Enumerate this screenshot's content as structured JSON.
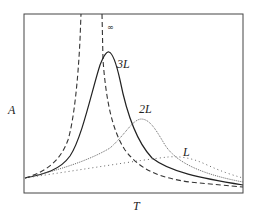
{
  "chart_data": {
    "type": "line",
    "title": "",
    "xlabel": "T",
    "ylabel": "A",
    "grid": false,
    "legend": "inline curve labels",
    "frame": {
      "left": 24,
      "top": 14,
      "right": 243,
      "bottom": 193
    },
    "series": [
      {
        "name": "∞",
        "label_text": "∞",
        "style": "dashed",
        "color": "#333333",
        "label_pos": [
          107,
          30
        ],
        "path": "M25,178 C45,172 60,162 68,140 C74,120 78,80 80,40 L81,14 M102,14 L103,60 C106,100 112,130 125,150 C140,170 160,178 190,182 C210,184 230,186 243,187"
      },
      {
        "name": "3L",
        "label_text": "3L",
        "style": "solid",
        "color": "#222222",
        "label_pos": [
          117,
          68
        ],
        "path": "M25,178 C45,174 60,170 70,156 C82,138 92,90 100,65 C104,55 107,51 109,52 C112,53 116,62 120,80 C126,110 135,140 152,158 C170,172 200,178 243,185"
      },
      {
        "name": "2L",
        "label_text": "2L",
        "style": "dotted",
        "color": "#555555",
        "label_pos": [
          139,
          113
        ],
        "path": "M25,178 C60,170 90,160 110,148 C125,135 132,120 141,119 C150,119 156,130 165,145 C176,162 200,174 243,182"
      },
      {
        "name": "L",
        "label_text": "L",
        "style": "sparse-dotted",
        "color": "#666666",
        "label_pos": [
          183,
          156
        ],
        "path": "M25,178 C80,170 140,160 168,157 C180,156 192,158 205,164 C220,171 232,175 243,178"
      }
    ]
  },
  "axes": {
    "x_label": "T",
    "y_label": "A"
  }
}
